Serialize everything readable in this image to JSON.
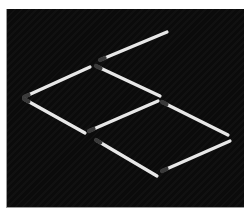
{
  "puzzle": {
    "type": "matchstick-puzzle",
    "background_color": "#0b0b0b",
    "match_color": "#e8e8e8",
    "head_color": "#3a3a3a",
    "match_count": 8,
    "matches": [
      {
        "id": "m1",
        "head": [
          100,
          60
        ],
        "tail": [
          167,
          32
        ]
      },
      {
        "id": "m2",
        "head": [
          24,
          97
        ],
        "tail": [
          90,
          67
        ]
      },
      {
        "id": "m3",
        "head": [
          96,
          66
        ],
        "tail": [
          160,
          96
        ]
      },
      {
        "id": "m4",
        "head": [
          24,
          99
        ],
        "tail": [
          85,
          133
        ]
      },
      {
        "id": "m5",
        "head": [
          89,
          131
        ],
        "tail": [
          158,
          101
        ]
      },
      {
        "id": "m6",
        "head": [
          162,
          102
        ],
        "tail": [
          228,
          135
        ]
      },
      {
        "id": "m7",
        "head": [
          96,
          140
        ],
        "tail": [
          157,
          176
        ]
      },
      {
        "id": "m8",
        "head": [
          162,
          171
        ],
        "tail": [
          230,
          141
        ]
      }
    ]
  }
}
